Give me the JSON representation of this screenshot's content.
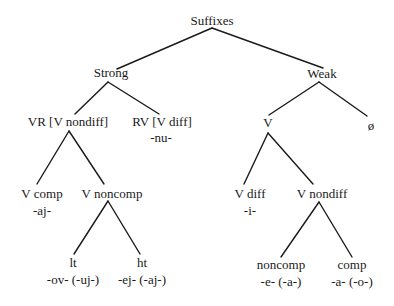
{
  "tree": {
    "root": {
      "label": "Suffixes"
    },
    "strong": {
      "label": "Strong",
      "vr": {
        "label": "VR [V nondiff]",
        "v_comp": {
          "label": "V comp",
          "suffix": "-aj-"
        },
        "v_noncomp": {
          "label": "V noncomp",
          "lt": {
            "label": "lt",
            "suffix": "-ov- (-uj-)"
          },
          "ht": {
            "label": "ht",
            "suffix": "-ej- (-aj-)"
          }
        }
      },
      "rv": {
        "label": "RV [V diff]",
        "suffix": "-nu-"
      }
    },
    "weak": {
      "label": "Weak",
      "v": {
        "label": "V",
        "v_diff": {
          "label": "V diff",
          "suffix": "-i-"
        },
        "v_nondiff": {
          "label": "V nondiff",
          "noncomp": {
            "label": "noncomp",
            "suffix": "-e- (-a-)"
          },
          "comp": {
            "label": "comp",
            "suffix": "-a- (-o-)"
          }
        }
      },
      "null": {
        "label": "ø"
      }
    }
  },
  "edges": [
    {
      "from": "Suffixes",
      "to": "Strong"
    },
    {
      "from": "Suffixes",
      "to": "Weak"
    },
    {
      "from": "Strong",
      "to": "VR [V nondiff]"
    },
    {
      "from": "Strong",
      "to": "RV [V diff]"
    },
    {
      "from": "Weak",
      "to": "V"
    },
    {
      "from": "Weak",
      "to": "ø"
    },
    {
      "from": "VR [V nondiff]",
      "to": "V comp"
    },
    {
      "from": "VR [V nondiff]",
      "to": "V noncomp"
    },
    {
      "from": "V noncomp",
      "to": "lt"
    },
    {
      "from": "V noncomp",
      "to": "ht"
    },
    {
      "from": "V",
      "to": "V diff"
    },
    {
      "from": "V",
      "to": "V nondiff"
    },
    {
      "from": "V nondiff",
      "to": "noncomp"
    },
    {
      "from": "V nondiff",
      "to": "comp"
    }
  ],
  "colors": {
    "ink": "#1a1a1a",
    "background": "#ffffff"
  }
}
